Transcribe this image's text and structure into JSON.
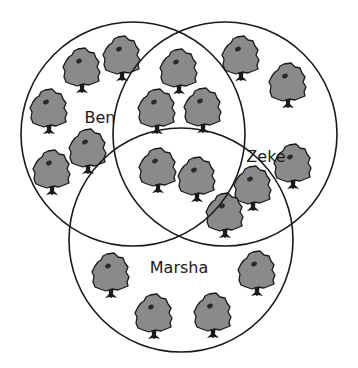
{
  "diagram": {
    "type": "venn",
    "circles": [
      {
        "id": "ben",
        "label": "Ben",
        "cx": 133,
        "cy": 134,
        "r": 112,
        "label_x": 100,
        "label_y": 118
      },
      {
        "id": "zeke",
        "label": "Zeke",
        "cx": 225,
        "cy": 134,
        "r": 112,
        "label_x": 266,
        "label_y": 157
      },
      {
        "id": "marsha",
        "label": "Marsha",
        "cx": 181,
        "cy": 240,
        "r": 112,
        "label_x": 179,
        "label_y": 268
      }
    ],
    "colors": {
      "stroke": "#1a1a1a",
      "tree_canopy": "#8a8a8a",
      "tree_outline": "#1a1a1a",
      "background": "#ffffff"
    },
    "regions": {
      "ben_only": 5,
      "zeke_only": 3,
      "marsha_only": 4,
      "ben_zeke_only": 3,
      "zeke_marsha_only": 2,
      "ben_marsha_only": 0,
      "all_three": 2
    },
    "trees": [
      {
        "region": "ben_only",
        "x": 63,
        "y": 47
      },
      {
        "region": "ben_only",
        "x": 103,
        "y": 35
      },
      {
        "region": "ben_only",
        "x": 30,
        "y": 88
      },
      {
        "region": "ben_only",
        "x": 69,
        "y": 128
      },
      {
        "region": "ben_only",
        "x": 33,
        "y": 149
      },
      {
        "region": "ben_zeke_only",
        "x": 160,
        "y": 48
      },
      {
        "region": "ben_zeke_only",
        "x": 138,
        "y": 88
      },
      {
        "region": "ben_zeke_only",
        "x": 184,
        "y": 87
      },
      {
        "region": "all_three",
        "x": 139,
        "y": 147
      },
      {
        "region": "all_three",
        "x": 178,
        "y": 156
      },
      {
        "region": "zeke_marsha_only",
        "x": 234,
        "y": 165
      },
      {
        "region": "zeke_marsha_only",
        "x": 206,
        "y": 192
      },
      {
        "region": "zeke_only",
        "x": 222,
        "y": 35
      },
      {
        "region": "zeke_only",
        "x": 269,
        "y": 62
      },
      {
        "region": "zeke_only",
        "x": 274,
        "y": 143
      },
      {
        "region": "marsha_only",
        "x": 92,
        "y": 252
      },
      {
        "region": "marsha_only",
        "x": 135,
        "y": 293
      },
      {
        "region": "marsha_only",
        "x": 238,
        "y": 250
      },
      {
        "region": "marsha_only",
        "x": 194,
        "y": 292
      }
    ]
  }
}
